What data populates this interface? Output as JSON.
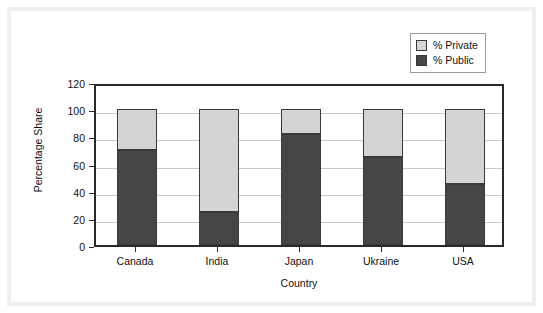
{
  "chart_data": {
    "type": "bar",
    "subtype": "stacked-vertical",
    "title": "",
    "xlabel": "Country",
    "ylabel": "Percentage Share",
    "categories": [
      "Canada",
      "India",
      "Japan",
      "Ukraine",
      "USA"
    ],
    "series": [
      {
        "name": "% Public",
        "values": [
          70,
          24,
          82,
          65,
          45
        ],
        "color": "#454545"
      },
      {
        "name": "% Private",
        "values": [
          30,
          76,
          18,
          35,
          55
        ],
        "color": "#d4d4d4"
      }
    ],
    "stack_order": [
      "% Public",
      "% Private"
    ],
    "stack_totals": [
      100,
      100,
      100,
      100,
      100
    ],
    "ylim": [
      0,
      120
    ],
    "yticks": [
      0,
      20,
      40,
      60,
      80,
      100,
      120
    ],
    "ytick_labels": [
      "0",
      "20",
      "40",
      "60",
      "80",
      "100",
      "120"
    ],
    "grid": true,
    "grid_axis": "y",
    "legend_position": "top-right",
    "legend_entries": [
      "% Private",
      "% Public"
    ]
  },
  "axes": {
    "y_title": "Percentage Share",
    "x_title": "Country"
  },
  "colors": {
    "public": "#454545",
    "private": "#d4d4d4",
    "axis": "#2a2a2a",
    "grid": "#c8c8c8",
    "frame": "#efefef",
    "background": "#ffffff"
  }
}
